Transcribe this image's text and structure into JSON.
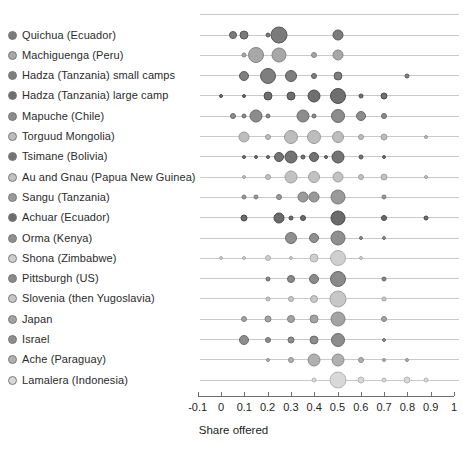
{
  "chart_data": {
    "type": "scatter",
    "title": "",
    "xlabel": "Share offered",
    "ylabel": "",
    "xlim": [
      -0.1,
      1.0
    ],
    "xticks": [
      -0.1,
      0,
      0.1,
      0.2,
      0.3,
      0.4,
      0.5,
      0.6,
      0.7,
      0.8,
      0.9,
      1
    ],
    "xtick_labels": [
      "-0.1",
      "0",
      "0.1",
      "0.2",
      "0.3",
      "0.4",
      "0.5",
      "0.6",
      "0.7",
      "0.8",
      "0.9",
      "1"
    ],
    "grid": true,
    "legend": "none",
    "note": "Bubble size encodes relative frequency of each offer share within a group.",
    "series": [
      {
        "name": "Quichua (Ecuador)",
        "marker_shade": "#7b7b7b",
        "points": [
          {
            "x": 0.05,
            "size": 8
          },
          {
            "x": 0.1,
            "size": 9
          },
          {
            "x": 0.2,
            "size": 5
          },
          {
            "x": 0.25,
            "size": 17
          },
          {
            "x": 0.5,
            "size": 11
          }
        ]
      },
      {
        "name": "Machiguenga (Peru)",
        "marker_shade": "#a8a8a8",
        "points": [
          {
            "x": 0.1,
            "size": 5
          },
          {
            "x": 0.15,
            "size": 16
          },
          {
            "x": 0.25,
            "size": 15
          },
          {
            "x": 0.4,
            "size": 6
          },
          {
            "x": 0.5,
            "size": 11
          }
        ]
      },
      {
        "name": "Hadza (Tanzania) small camps",
        "marker_shade": "#7e7e7e",
        "points": [
          {
            "x": 0.1,
            "size": 10
          },
          {
            "x": 0.2,
            "size": 16
          },
          {
            "x": 0.3,
            "size": 12
          },
          {
            "x": 0.4,
            "size": 6
          },
          {
            "x": 0.5,
            "size": 9
          },
          {
            "x": 0.8,
            "size": 5
          }
        ]
      },
      {
        "name": "Hadza (Tanzania) large camp",
        "marker_shade": "#6f6f6f",
        "points": [
          {
            "x": 0.0,
            "size": 4
          },
          {
            "x": 0.1,
            "size": 4
          },
          {
            "x": 0.2,
            "size": 9
          },
          {
            "x": 0.3,
            "size": 9
          },
          {
            "x": 0.4,
            "size": 13
          },
          {
            "x": 0.5,
            "size": 16
          },
          {
            "x": 0.6,
            "size": 5
          },
          {
            "x": 0.7,
            "size": 7
          }
        ]
      },
      {
        "name": "Mapuche (Chile)",
        "marker_shade": "#8c8c8c",
        "points": [
          {
            "x": 0.05,
            "size": 6
          },
          {
            "x": 0.1,
            "size": 5
          },
          {
            "x": 0.15,
            "size": 13
          },
          {
            "x": 0.2,
            "size": 5
          },
          {
            "x": 0.35,
            "size": 13
          },
          {
            "x": 0.4,
            "size": 5
          },
          {
            "x": 0.5,
            "size": 14
          },
          {
            "x": 0.6,
            "size": 10
          },
          {
            "x": 0.7,
            "size": 6
          }
        ]
      },
      {
        "name": "Torguud Mongolia)",
        "marker_shade": "#bdbdbd",
        "points": [
          {
            "x": 0.1,
            "size": 11
          },
          {
            "x": 0.2,
            "size": 6
          },
          {
            "x": 0.3,
            "size": 14
          },
          {
            "x": 0.4,
            "size": 14
          },
          {
            "x": 0.5,
            "size": 12
          },
          {
            "x": 0.6,
            "size": 6
          },
          {
            "x": 0.7,
            "size": 7
          },
          {
            "x": 0.88,
            "size": 4
          }
        ]
      },
      {
        "name": "Tsimane (Bolivia)",
        "marker_shade": "#737373",
        "points": [
          {
            "x": 0.1,
            "size": 4
          },
          {
            "x": 0.15,
            "size": 4
          },
          {
            "x": 0.2,
            "size": 4
          },
          {
            "x": 0.25,
            "size": 10
          },
          {
            "x": 0.3,
            "size": 13
          },
          {
            "x": 0.35,
            "size": 5
          },
          {
            "x": 0.4,
            "size": 10
          },
          {
            "x": 0.45,
            "size": 4
          },
          {
            "x": 0.5,
            "size": 13
          },
          {
            "x": 0.6,
            "size": 5
          },
          {
            "x": 0.7,
            "size": 4
          }
        ]
      },
      {
        "name": "Au and Gnau (Papua New Guinea)",
        "marker_shade": "#c2c2c2",
        "points": [
          {
            "x": 0.1,
            "size": 4
          },
          {
            "x": 0.2,
            "size": 6
          },
          {
            "x": 0.3,
            "size": 13
          },
          {
            "x": 0.4,
            "size": 12
          },
          {
            "x": 0.5,
            "size": 11
          },
          {
            "x": 0.6,
            "size": 6
          },
          {
            "x": 0.7,
            "size": 7
          },
          {
            "x": 0.88,
            "size": 4
          }
        ]
      },
      {
        "name": "Sangu (Tanzania)",
        "marker_shade": "#9a9a9a",
        "points": [
          {
            "x": 0.1,
            "size": 5
          },
          {
            "x": 0.15,
            "size": 5
          },
          {
            "x": 0.25,
            "size": 6
          },
          {
            "x": 0.35,
            "size": 11
          },
          {
            "x": 0.4,
            "size": 11
          },
          {
            "x": 0.5,
            "size": 15
          },
          {
            "x": 0.7,
            "size": 5
          }
        ]
      },
      {
        "name": "Achuar (Ecuador)",
        "marker_shade": "#6b6b6b",
        "points": [
          {
            "x": 0.1,
            "size": 7
          },
          {
            "x": 0.25,
            "size": 11
          },
          {
            "x": 0.3,
            "size": 5
          },
          {
            "x": 0.35,
            "size": 6
          },
          {
            "x": 0.5,
            "size": 15
          },
          {
            "x": 0.7,
            "size": 6
          },
          {
            "x": 0.88,
            "size": 5
          }
        ]
      },
      {
        "name": "Orma (Kenya)",
        "marker_shade": "#8f8f8f",
        "points": [
          {
            "x": 0.3,
            "size": 12
          },
          {
            "x": 0.4,
            "size": 10
          },
          {
            "x": 0.5,
            "size": 15
          },
          {
            "x": 0.6,
            "size": 4
          },
          {
            "x": 0.7,
            "size": 4
          }
        ]
      },
      {
        "name": "Shona (Zimbabwe)",
        "marker_shade": "#cfcfcf",
        "points": [
          {
            "x": 0.0,
            "size": 4
          },
          {
            "x": 0.1,
            "size": 4
          },
          {
            "x": 0.2,
            "size": 6
          },
          {
            "x": 0.3,
            "size": 4
          },
          {
            "x": 0.4,
            "size": 9
          },
          {
            "x": 0.5,
            "size": 16
          },
          {
            "x": 0.6,
            "size": 4
          }
        ]
      },
      {
        "name": "Pittsburgh (US)",
        "marker_shade": "#8a8a8a",
        "points": [
          {
            "x": 0.2,
            "size": 5
          },
          {
            "x": 0.3,
            "size": 8
          },
          {
            "x": 0.4,
            "size": 10
          },
          {
            "x": 0.5,
            "size": 16
          },
          {
            "x": 0.7,
            "size": 5
          }
        ]
      },
      {
        "name": "Slovenia (then Yugoslavia)",
        "marker_shade": "#c7c7c7",
        "points": [
          {
            "x": 0.2,
            "size": 5
          },
          {
            "x": 0.3,
            "size": 6
          },
          {
            "x": 0.4,
            "size": 8
          },
          {
            "x": 0.5,
            "size": 17
          },
          {
            "x": 0.7,
            "size": 5
          }
        ]
      },
      {
        "name": "Japan",
        "marker_shade": "#a3a3a3",
        "points": [
          {
            "x": 0.1,
            "size": 6
          },
          {
            "x": 0.2,
            "size": 7
          },
          {
            "x": 0.3,
            "size": 8
          },
          {
            "x": 0.4,
            "size": 9
          },
          {
            "x": 0.5,
            "size": 15
          },
          {
            "x": 0.7,
            "size": 6
          }
        ]
      },
      {
        "name": "Israel",
        "marker_shade": "#8d8d8d",
        "points": [
          {
            "x": 0.1,
            "size": 10
          },
          {
            "x": 0.2,
            "size": 6
          },
          {
            "x": 0.3,
            "size": 7
          },
          {
            "x": 0.4,
            "size": 9
          },
          {
            "x": 0.5,
            "size": 14
          },
          {
            "x": 0.7,
            "size": 4
          }
        ]
      },
      {
        "name": "Ache  (Paraguay)",
        "marker_shade": "#b0b0b0",
        "points": [
          {
            "x": 0.2,
            "size": 4
          },
          {
            "x": 0.3,
            "size": 6
          },
          {
            "x": 0.4,
            "size": 13
          },
          {
            "x": 0.5,
            "size": 13
          },
          {
            "x": 0.6,
            "size": 6
          },
          {
            "x": 0.7,
            "size": 4
          },
          {
            "x": 0.8,
            "size": 4
          }
        ]
      },
      {
        "name": "Lamalera (Indonesia)",
        "marker_shade": "#d8d8d8",
        "points": [
          {
            "x": 0.4,
            "size": 5
          },
          {
            "x": 0.5,
            "size": 17
          },
          {
            "x": 0.6,
            "size": 7
          },
          {
            "x": 0.7,
            "size": 5
          },
          {
            "x": 0.8,
            "size": 7
          },
          {
            "x": 0.88,
            "size": 5
          }
        ]
      }
    ]
  }
}
